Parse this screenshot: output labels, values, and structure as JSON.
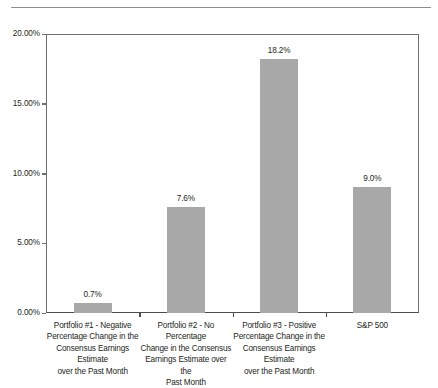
{
  "chart_data": {
    "type": "bar",
    "title": "",
    "xlabel": "",
    "ylabel": "",
    "ylim": [
      0,
      20
    ],
    "grid": false,
    "legend": "none",
    "categories": [
      "Portfolio #1 - Negative Percentage Change in the Consensus Earnings Estimate over the Past Month",
      "Portfolio #2 - No Percentage Change in the Consensus Earnings Estimate over the Past Month",
      "Portfolio #3 - Positive Percentage Change in the Consensus Earnings Estimate over the Past Month",
      "S&P 500"
    ],
    "category_lines": [
      [
        "Portfolio #1 - Negative",
        "Percentage Change in the",
        "Consensus Earnings Estimate",
        "over the Past Month"
      ],
      [
        "Portfolio #2 - No Percentage",
        "Change in the Consensus",
        "Earnings Estimate over the",
        "Past Month"
      ],
      [
        "Portfolio #3 - Positive",
        "Percentage Change in the",
        "Consensus Earnings Estimate",
        "over the Past Month"
      ],
      [
        "S&P 500"
      ]
    ],
    "values": [
      0.7,
      7.6,
      18.2,
      9.0
    ],
    "value_labels": [
      "0.7%",
      "7.6%",
      "18.2%",
      "9.0%"
    ],
    "y_ticks": [
      0,
      5,
      10,
      15,
      20
    ],
    "y_tick_labels": [
      "0.00%",
      "5.00%",
      "10.00%",
      "15.00%",
      "20.00%"
    ],
    "bar_color": "#a8a8a8",
    "axis_color": "#6e6e6e",
    "text_color": "#231f20"
  }
}
